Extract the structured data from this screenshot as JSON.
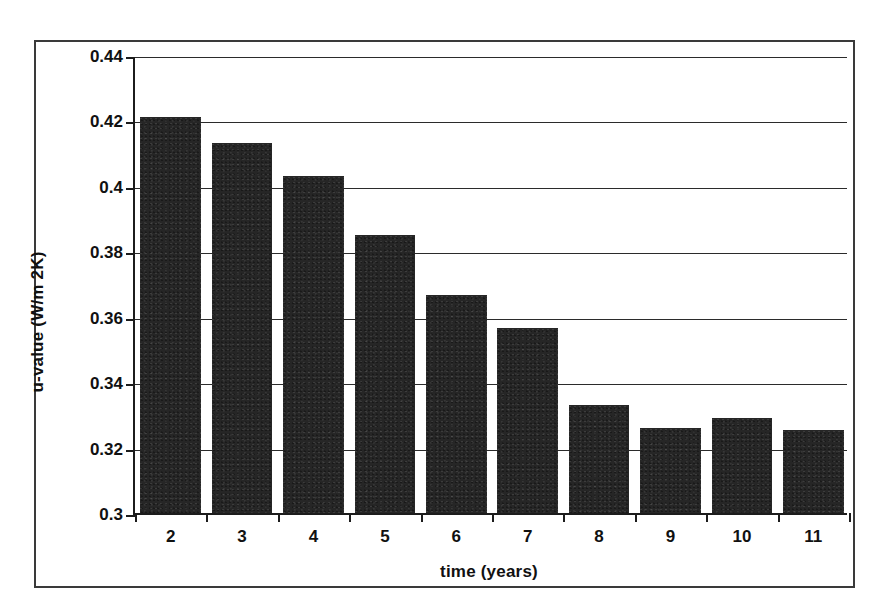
{
  "chart_data": {
    "type": "bar",
    "title": "",
    "xlabel": "time (years)",
    "ylabel": "u-value (W/m 2K)",
    "categories": [
      "2",
      "3",
      "4",
      "5",
      "6",
      "7",
      "8",
      "9",
      "10",
      "11"
    ],
    "values": [
      0.421,
      0.413,
      0.403,
      0.385,
      0.3665,
      0.3565,
      0.333,
      0.326,
      0.329,
      0.3255
    ],
    "series": [
      {
        "name": "u-value",
        "values": [
          0.421,
          0.413,
          0.403,
          0.385,
          0.3665,
          0.3565,
          0.333,
          0.326,
          0.329,
          0.3255
        ]
      }
    ],
    "ylim": [
      0.3,
      0.44
    ],
    "yticks": [
      0.3,
      0.32,
      0.34,
      0.36,
      0.38,
      0.4,
      0.42,
      0.44
    ],
    "ytick_labels": [
      "0.3",
      "0.32",
      "0.34",
      "0.36",
      "0.38",
      "0.4",
      "0.42",
      "0.44"
    ],
    "grid": "horizontal",
    "legend": "none",
    "bar_color": "#262626",
    "axis_color": "#1c1c1c",
    "frame_color": "#3a3a3a",
    "bar_width_ratio": 0.85
  }
}
